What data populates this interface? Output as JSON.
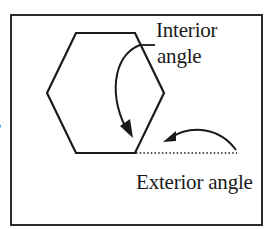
{
  "diagram": {
    "shape": "hexagon",
    "labels": {
      "interior_line1": "Interior",
      "interior_line2": "angle",
      "exterior": "Exterior angle",
      "clipped_left_text": "s"
    },
    "hexagon_vertices": [
      [
        76,
        33
      ],
      [
        135,
        33
      ],
      [
        164,
        93
      ],
      [
        135,
        153
      ],
      [
        76,
        153
      ],
      [
        47,
        93
      ]
    ],
    "exterior_extension": {
      "from": [
        135,
        153
      ],
      "to": [
        237,
        153
      ],
      "style": "dotted"
    },
    "arrows": [
      {
        "name": "interior-angle-arrow",
        "points_to": "interior angle at bottom-right vertex"
      },
      {
        "name": "exterior-angle-arrow",
        "points_to": "exterior angle between side and dotted extension"
      }
    ],
    "colors": {
      "stroke": "#1a1a1a",
      "frame": "#2a2a2a",
      "background": "#ffffff"
    }
  }
}
